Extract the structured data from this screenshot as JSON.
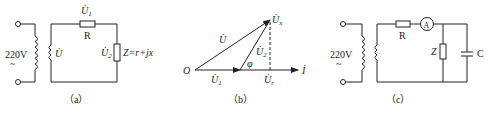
{
  "figure": {
    "panels": [
      {
        "id": "a",
        "caption": "（a）",
        "source_label": "220V",
        "source_symbol": "~",
        "secondary_voltage": "U̇",
        "resistor_label": "R",
        "resistor_voltage": "U̇",
        "resistor_voltage_sub": "1",
        "load_voltage": "U̇",
        "load_voltage_sub": "2",
        "load_label": "Z=r+jx"
      },
      {
        "id": "b",
        "caption": "（b）",
        "origin": "O",
        "vec_total": "U̇",
        "vec_u1": "U̇",
        "vec_u1_sub": "1",
        "vec_u2": "U̇",
        "vec_u2_sub": "2",
        "vec_ux": "U̇",
        "vec_ux_sub": "x",
        "vec_ur": "U̇",
        "vec_ur_sub": "r",
        "angle": "φ",
        "current": "İ"
      },
      {
        "id": "c",
        "caption": "（c）",
        "source_label": "220V",
        "source_symbol": "~",
        "resistor_label": "R",
        "ammeter_label": "A",
        "load_label": "Z",
        "capacitor_label": "C"
      }
    ]
  }
}
